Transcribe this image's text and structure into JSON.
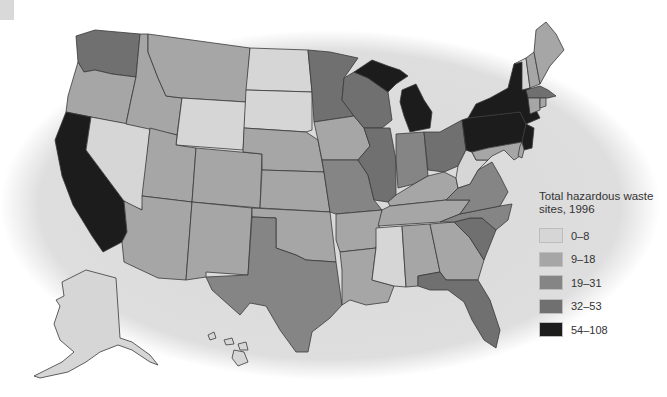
{
  "legend": {
    "title_line1": "Total hazardous waste",
    "title_line2": "sites, 1996",
    "classes": [
      {
        "label": "0–8",
        "color": "#d6d6d6"
      },
      {
        "label": "9–18",
        "color": "#a6a6a6"
      },
      {
        "label": "19–31",
        "color": "#858585"
      },
      {
        "label": "32–53",
        "color": "#707070"
      },
      {
        "label": "54–108",
        "color": "#1c1c1c"
      }
    ]
  },
  "colors": {
    "background_oval": "#dcdcdc",
    "page": "#ffffff",
    "border": "#3a3a3a"
  },
  "states": [
    {
      "name": "Washington",
      "class": 3
    },
    {
      "name": "Oregon",
      "class": 1
    },
    {
      "name": "California",
      "class": 4
    },
    {
      "name": "Nevada",
      "class": 0
    },
    {
      "name": "Idaho",
      "class": 1
    },
    {
      "name": "Montana",
      "class": 1
    },
    {
      "name": "Wyoming",
      "class": 0
    },
    {
      "name": "Utah",
      "class": 1
    },
    {
      "name": "Arizona",
      "class": 1
    },
    {
      "name": "Colorado",
      "class": 1
    },
    {
      "name": "New Mexico",
      "class": 1
    },
    {
      "name": "North Dakota",
      "class": 0
    },
    {
      "name": "South Dakota",
      "class": 0
    },
    {
      "name": "Nebraska",
      "class": 1
    },
    {
      "name": "Kansas",
      "class": 1
    },
    {
      "name": "Oklahoma",
      "class": 1
    },
    {
      "name": "Texas",
      "class": 2
    },
    {
      "name": "Minnesota",
      "class": 3
    },
    {
      "name": "Iowa",
      "class": 1
    },
    {
      "name": "Missouri",
      "class": 2
    },
    {
      "name": "Arkansas",
      "class": 1
    },
    {
      "name": "Louisiana",
      "class": 1
    },
    {
      "name": "Wisconsin",
      "class": 3
    },
    {
      "name": "Illinois",
      "class": 3
    },
    {
      "name": "Michigan",
      "class": 4
    },
    {
      "name": "Indiana",
      "class": 2
    },
    {
      "name": "Ohio",
      "class": 3
    },
    {
      "name": "Kentucky",
      "class": 1
    },
    {
      "name": "Tennessee",
      "class": 1
    },
    {
      "name": "Mississippi",
      "class": 0
    },
    {
      "name": "Alabama",
      "class": 1
    },
    {
      "name": "Georgia",
      "class": 1
    },
    {
      "name": "Florida",
      "class": 3
    },
    {
      "name": "South Carolina",
      "class": 3
    },
    {
      "name": "North Carolina",
      "class": 2
    },
    {
      "name": "Virginia",
      "class": 2
    },
    {
      "name": "West Virginia",
      "class": 0
    },
    {
      "name": "Pennsylvania",
      "class": 4
    },
    {
      "name": "New York",
      "class": 4
    },
    {
      "name": "New Jersey",
      "class": 4
    },
    {
      "name": "Delaware",
      "class": 1
    },
    {
      "name": "Maryland",
      "class": 1
    },
    {
      "name": "Connecticut",
      "class": 1
    },
    {
      "name": "Rhode Island",
      "class": 1
    },
    {
      "name": "Massachusetts",
      "class": 3
    },
    {
      "name": "Vermont",
      "class": 0
    },
    {
      "name": "New Hampshire",
      "class": 1
    },
    {
      "name": "Maine",
      "class": 1
    },
    {
      "name": "Alaska",
      "class": 0
    },
    {
      "name": "Hawaii",
      "class": 0
    }
  ]
}
